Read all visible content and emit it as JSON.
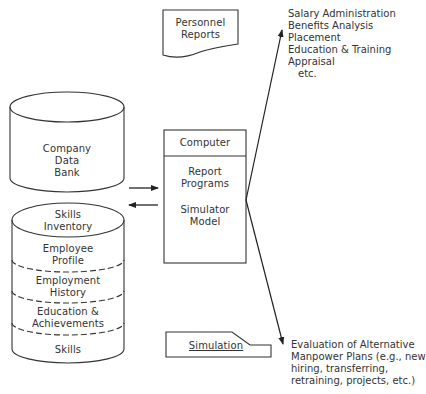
{
  "personnel_reports": {
    "line1": "Personnel",
    "line2": "Reports"
  },
  "company_data_bank": {
    "line1": "Company",
    "line2": "Data",
    "line3": "Bank"
  },
  "skills_inventory": {
    "title_line1": "Skills",
    "title_line2": "Inventory",
    "layers": [
      {
        "line1": "Employee",
        "line2": "Profile"
      },
      {
        "line1": "Employment",
        "line2": "History"
      },
      {
        "line1": "Education &",
        "line2": "Achievements"
      },
      {
        "line1": "Skills"
      }
    ]
  },
  "computer": {
    "header": "Computer",
    "programs_line1": "Report",
    "programs_line2": "Programs",
    "model_line1": "Simulator",
    "model_line2": "Model"
  },
  "simulation": {
    "label": "Simulation"
  },
  "outputs_top": {
    "items": [
      "Salary Administration",
      "Benefits Analysis",
      "Placement",
      "Education & Training",
      "Appraisal",
      "etc."
    ]
  },
  "outputs_bottom": {
    "lines": [
      "Evaluation of Alternative",
      "Manpower Plans (e.g., new",
      "hiring, transferring,",
      "retraining, projects, etc.)"
    ]
  }
}
